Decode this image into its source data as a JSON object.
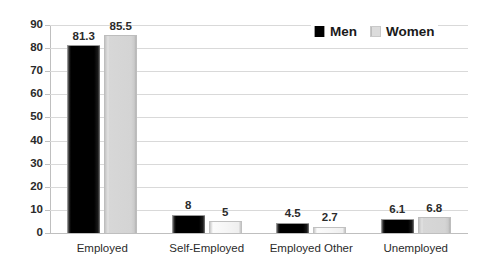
{
  "chart_data": {
    "type": "bar",
    "title": "",
    "subtitle": "",
    "xlabel": "",
    "ylabel": "",
    "categories": [
      "Employed",
      "Self-Employed",
      "Employed Other",
      "Unemployed"
    ],
    "series": [
      {
        "name": "Men",
        "values": [
          81.3,
          8,
          4.5,
          6.1
        ],
        "color": "#000000"
      },
      {
        "name": "Women",
        "values": [
          85.5,
          5,
          2.7,
          6.8
        ],
        "color": "#d7d7d7"
      }
    ],
    "value_labels": {
      "Men": [
        "81.3",
        "8",
        "4.5",
        "6.1"
      ],
      "Women": [
        "85.5",
        "5",
        "2.7",
        "6.8"
      ]
    },
    "ylim": [
      0,
      90
    ],
    "ytick_step": 10,
    "yticks": [
      0,
      10,
      20,
      30,
      40,
      50,
      60,
      70,
      80,
      90
    ],
    "ytick_labels": [
      "0",
      "10",
      "20",
      "30",
      "40",
      "50",
      "60",
      "70",
      "80",
      "90"
    ],
    "grid": {
      "horizontal": true,
      "vertical": false
    },
    "legend": {
      "position": "top-right-inside",
      "orientation": "horizontal"
    },
    "data_labels_shown": true
  },
  "legend": {
    "entries": [
      {
        "label": "Men",
        "swatch": "men"
      },
      {
        "label": "Women",
        "swatch": "women"
      }
    ]
  },
  "colors": {
    "background": "#ffffff",
    "gridline": "#d9d9d9",
    "axis": "#bfbfbf",
    "text": "#2b2b2b",
    "men": "#000000",
    "women": "#d7d7d7"
  }
}
